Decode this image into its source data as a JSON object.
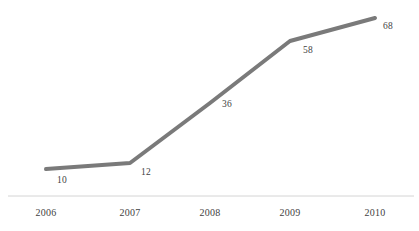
{
  "chart_data": {
    "type": "line",
    "title": "",
    "subtitle": "",
    "xlabel": "",
    "ylabel": "",
    "categories": [
      "2006",
      "2007",
      "2008",
      "2009",
      "2010"
    ],
    "values": [
      10,
      12,
      36,
      58,
      68
    ],
    "series": [
      {
        "name": "",
        "values": [
          10,
          12,
          36,
          58,
          68
        ]
      }
    ],
    "data_labels": [
      "10",
      "12",
      "36",
      "58",
      "68"
    ],
    "show_data_labels": true,
    "grid": false,
    "legend": false,
    "legend_position": "none",
    "y_axis_visible": false,
    "x_axis_visible": true,
    "xlim": [
      2006,
      2010
    ],
    "ylim": [
      0,
      75
    ],
    "colors": {
      "line": "#7a7a7a",
      "axis": "#d4d4d4",
      "label_text": "#3f3f3f",
      "tick_text": "#3f3f3f",
      "background": "#ffffff"
    },
    "line_width": 4,
    "marker": "none"
  },
  "axis": {
    "ticks": [
      {
        "label": "2006",
        "x": 46
      },
      {
        "label": "2007",
        "x": 130
      },
      {
        "label": "2008",
        "x": 210
      },
      {
        "label": "2009",
        "x": 290
      },
      {
        "label": "2010",
        "x": 375
      }
    ]
  },
  "points": [
    {
      "value": "10",
      "px": 46,
      "py": 169,
      "lx": 57,
      "ly": 176
    },
    {
      "value": "12",
      "px": 130,
      "py": 163,
      "lx": 141,
      "ly": 168
    },
    {
      "value": "36",
      "px": 210,
      "py": 103,
      "lx": 222,
      "ly": 100
    },
    {
      "value": "58",
      "px": 290,
      "py": 41,
      "lx": 303,
      "ly": 46
    },
    {
      "value": "68",
      "px": 375,
      "py": 18,
      "lx": 383,
      "ly": 22
    }
  ]
}
